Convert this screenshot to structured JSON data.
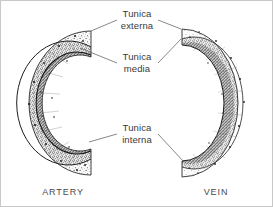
{
  "figure": {
    "type": "histology-diagram",
    "background_color": "#ffffff",
    "ink_color": "#2b2b2b",
    "leader_line_color": "#555555",
    "border_color": "#c8c8c8"
  },
  "labels": {
    "tunica_externa": {
      "line1": "Tunica",
      "line2": "externa"
    },
    "tunica_media": {
      "line1": "Tunica",
      "line2": "media"
    },
    "tunica_interna": {
      "line1": "Tunica",
      "line2": "interna"
    }
  },
  "captions": {
    "artery": "ARTERY",
    "vein": "VEIN"
  },
  "structures": {
    "artery": {
      "name": "artery",
      "orientation": "C-shaped cross-section opening to the right",
      "wall": "thick",
      "lumen": "narrow",
      "layers": [
        "tunica externa",
        "tunica media",
        "tunica interna"
      ]
    },
    "vein": {
      "name": "vein",
      "orientation": "C-shaped cross-section opening to the left",
      "wall": "thin",
      "lumen": "wide",
      "layers": [
        "tunica externa",
        "tunica media",
        "tunica interna"
      ]
    }
  },
  "leaders": [
    {
      "label": "tunica-externa",
      "target": "artery-outer-layer"
    },
    {
      "label": "tunica-externa",
      "target": "vein-outer-layer"
    },
    {
      "label": "tunica-media",
      "target": "artery-middle-layer"
    },
    {
      "label": "tunica-media",
      "target": "vein-middle-layer"
    },
    {
      "label": "tunica-interna",
      "target": "artery-inner-layer"
    },
    {
      "label": "tunica-interna",
      "target": "vein-inner-layer"
    }
  ]
}
